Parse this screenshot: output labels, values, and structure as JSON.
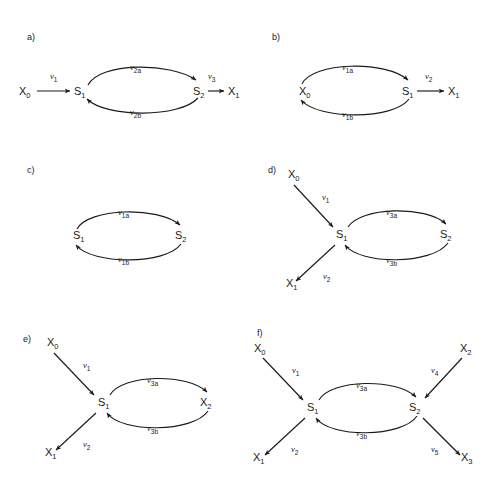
{
  "figure": {
    "background": "#ffffff",
    "stroke_color": "#1a1a1a",
    "width": 497,
    "height": 485
  },
  "panels": [
    {
      "id": "a",
      "label": "a)",
      "nodes": [
        {
          "name": "X0",
          "base": "X",
          "sub": "0"
        },
        {
          "name": "S1",
          "base": "S",
          "sub": "1"
        },
        {
          "name": "S2",
          "base": "S",
          "sub": "2"
        },
        {
          "name": "X1",
          "base": "X",
          "sub": "1"
        }
      ],
      "edges": [
        {
          "from": "X0",
          "to": "S1",
          "rate_base": "v",
          "rate_sub": "1",
          "shape": "straight"
        },
        {
          "from": "S1",
          "to": "S2",
          "rate_base": "v",
          "rate_sub": "2a",
          "shape": "arc-top"
        },
        {
          "from": "S2",
          "to": "S1",
          "rate_base": "v",
          "rate_sub": "2b",
          "shape": "arc-bottom"
        },
        {
          "from": "S2",
          "to": "X1",
          "rate_base": "v",
          "rate_sub": "3",
          "shape": "straight"
        }
      ]
    },
    {
      "id": "b",
      "label": "b)",
      "nodes": [
        {
          "name": "X0",
          "base": "X",
          "sub": "0"
        },
        {
          "name": "S1",
          "base": "S",
          "sub": "1"
        },
        {
          "name": "X1",
          "base": "X",
          "sub": "1"
        }
      ],
      "edges": [
        {
          "from": "X0",
          "to": "S1",
          "rate_base": "v",
          "rate_sub": "1a",
          "shape": "arc-top"
        },
        {
          "from": "S1",
          "to": "X0",
          "rate_base": "v",
          "rate_sub": "1b",
          "shape": "arc-bottom"
        },
        {
          "from": "S1",
          "to": "X1",
          "rate_base": "v",
          "rate_sub": "2",
          "shape": "straight"
        }
      ]
    },
    {
      "id": "c",
      "label": "c)",
      "nodes": [
        {
          "name": "S1",
          "base": "S",
          "sub": "1"
        },
        {
          "name": "S2",
          "base": "S",
          "sub": "2"
        }
      ],
      "edges": [
        {
          "from": "S1",
          "to": "S2",
          "rate_base": "v",
          "rate_sub": "1a",
          "shape": "arc-top"
        },
        {
          "from": "S2",
          "to": "S1",
          "rate_base": "v",
          "rate_sub": "1b",
          "shape": "arc-bottom"
        }
      ]
    },
    {
      "id": "d",
      "label": "d)",
      "nodes": [
        {
          "name": "X0",
          "base": "X",
          "sub": "0"
        },
        {
          "name": "S1",
          "base": "S",
          "sub": "1"
        },
        {
          "name": "S2",
          "base": "S",
          "sub": "2"
        },
        {
          "name": "X1",
          "base": "X",
          "sub": "1"
        }
      ],
      "edges": [
        {
          "from": "X0",
          "to": "S1",
          "rate_base": "v",
          "rate_sub": "1",
          "shape": "diagonal"
        },
        {
          "from": "S1",
          "to": "X1",
          "rate_base": "v",
          "rate_sub": "2",
          "shape": "diagonal"
        },
        {
          "from": "S1",
          "to": "S2",
          "rate_base": "v",
          "rate_sub": "3a",
          "shape": "arc-top"
        },
        {
          "from": "S2",
          "to": "S1",
          "rate_base": "v",
          "rate_sub": "3b",
          "shape": "arc-bottom"
        }
      ]
    },
    {
      "id": "e",
      "label": "e)",
      "nodes": [
        {
          "name": "X0",
          "base": "X",
          "sub": "0"
        },
        {
          "name": "S1",
          "base": "S",
          "sub": "1"
        },
        {
          "name": "X2",
          "base": "X",
          "sub": "2"
        },
        {
          "name": "X1",
          "base": "X",
          "sub": "1"
        }
      ],
      "edges": [
        {
          "from": "X0",
          "to": "S1",
          "rate_base": "v",
          "rate_sub": "1",
          "shape": "diagonal"
        },
        {
          "from": "S1",
          "to": "X1",
          "rate_base": "v",
          "rate_sub": "2",
          "shape": "diagonal"
        },
        {
          "from": "S1",
          "to": "X2",
          "rate_base": "v",
          "rate_sub": "3a",
          "shape": "arc-top"
        },
        {
          "from": "X2",
          "to": "S1",
          "rate_base": "v",
          "rate_sub": "3b",
          "shape": "arc-bottom"
        }
      ]
    },
    {
      "id": "f",
      "label": "f)",
      "nodes": [
        {
          "name": "X0",
          "base": "X",
          "sub": "0"
        },
        {
          "name": "S1",
          "base": "S",
          "sub": "1"
        },
        {
          "name": "S2",
          "base": "S",
          "sub": "2"
        },
        {
          "name": "X1",
          "base": "X",
          "sub": "1"
        },
        {
          "name": "X2",
          "base": "X",
          "sub": "2"
        },
        {
          "name": "X3",
          "base": "X",
          "sub": "3"
        }
      ],
      "edges": [
        {
          "from": "X0",
          "to": "S1",
          "rate_base": "v",
          "rate_sub": "1",
          "shape": "diagonal"
        },
        {
          "from": "S1",
          "to": "X1",
          "rate_base": "v",
          "rate_sub": "2",
          "shape": "diagonal"
        },
        {
          "from": "S1",
          "to": "S2",
          "rate_base": "v",
          "rate_sub": "3a",
          "shape": "arc-top"
        },
        {
          "from": "S2",
          "to": "S1",
          "rate_base": "v",
          "rate_sub": "3b",
          "shape": "arc-bottom"
        },
        {
          "from": "X2",
          "to": "S2",
          "rate_base": "v",
          "rate_sub": "4",
          "shape": "diagonal"
        },
        {
          "from": "S2",
          "to": "X3",
          "rate_base": "v",
          "rate_sub": "5",
          "shape": "diagonal"
        }
      ]
    }
  ]
}
